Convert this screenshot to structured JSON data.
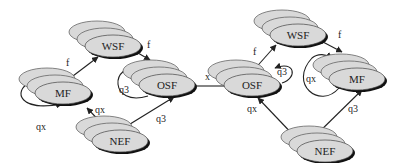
{
  "diagram": {
    "left_cluster": {
      "nodes": [
        {
          "id": "WSF",
          "label": "WSF",
          "cx": 113,
          "cy": 46
        },
        {
          "id": "MF",
          "label": "MF",
          "cx": 63,
          "cy": 93
        },
        {
          "id": "OSF",
          "label": "OSF",
          "cx": 167,
          "cy": 85
        },
        {
          "id": "NEF",
          "label": "NEF",
          "cx": 120,
          "cy": 141
        }
      ],
      "edges": [
        {
          "from": "MF",
          "to": "WSF",
          "label": "f"
        },
        {
          "from": "WSF",
          "to": "OSF",
          "label": "f"
        },
        {
          "from": "OSF",
          "to": "OSF",
          "label": "q3"
        },
        {
          "from": "MF",
          "to": "MF",
          "label": "qx"
        },
        {
          "from": "NEF",
          "to": "MF",
          "label": "qx"
        },
        {
          "from": "NEF",
          "to": "OSF",
          "label": "q3"
        }
      ]
    },
    "bridge": {
      "from": "OSF-left",
      "to": "OSF-right",
      "label": "x"
    },
    "right_cluster": {
      "nodes": [
        {
          "id": "WSF",
          "label": "WSF",
          "cx": 298,
          "cy": 35
        },
        {
          "id": "OSF",
          "label": "OSF",
          "cx": 252,
          "cy": 85
        },
        {
          "id": "MF",
          "label": "MF",
          "cx": 357,
          "cy": 79
        },
        {
          "id": "NEF",
          "label": "NEF",
          "cx": 325,
          "cy": 151
        }
      ],
      "edges": [
        {
          "from": "OSF",
          "to": "WSF",
          "label": "f"
        },
        {
          "from": "WSF",
          "to": "MF",
          "label": "f"
        },
        {
          "from": "OSF",
          "to": "OSF",
          "label": "q3"
        },
        {
          "from": "MF",
          "to": "MF",
          "label": "qx"
        },
        {
          "from": "NEF",
          "to": "OSF",
          "label": "qx"
        },
        {
          "from": "NEF",
          "to": "MF",
          "label": "q3"
        }
      ]
    },
    "colors": {
      "node_fill": "#d9d9d9",
      "node_stroke": "#333333",
      "shadow": "#111111",
      "edge": "#222222"
    }
  }
}
